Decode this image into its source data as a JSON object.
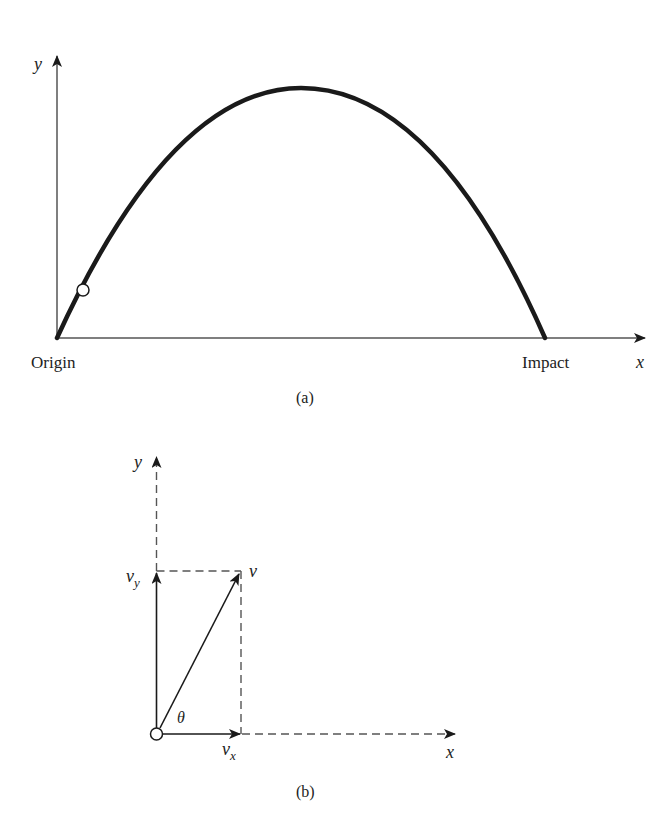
{
  "panel_a": {
    "caption": "(a)",
    "y_axis_label": "y",
    "x_axis_label": "x",
    "origin_label": "Origin",
    "impact_label": "Impact",
    "trajectory": {
      "type": "parabolic-trajectory",
      "start": "Origin",
      "end": "Impact",
      "marker": "projectile-position-circle"
    }
  },
  "panel_b": {
    "caption": "(b)",
    "y_axis_label": "y",
    "x_axis_label": "x",
    "velocity_label": "v",
    "vy_label": "v",
    "vy_subscript": "y",
    "vx_label": "v",
    "vx_subscript": "x",
    "angle_label": "θ"
  },
  "colors": {
    "ink": "#1a1a1a",
    "axis": "#555555",
    "background": "#ffffff"
  }
}
